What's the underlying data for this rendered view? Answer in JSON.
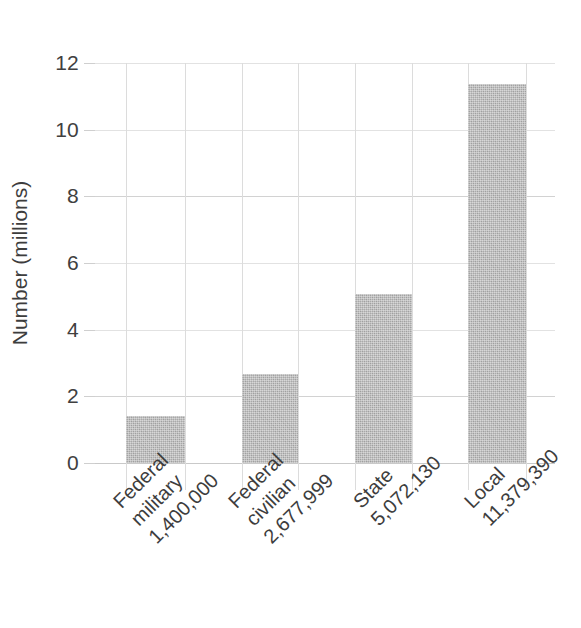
{
  "chart_data": {
    "type": "bar",
    "title": "",
    "subtitle": "",
    "xlabel": "",
    "ylabel": "Number (millions)",
    "categories": [
      "Federal military",
      "Federal civilian",
      "State",
      "Local"
    ],
    "category_lines": [
      [
        "Federal",
        "military",
        "1,400,000"
      ],
      [
        "Federal",
        "civilian",
        "2,677,999"
      ],
      [
        "State",
        "5,072,130"
      ],
      [
        "Local",
        "11,379,390"
      ]
    ],
    "data_labels": [
      "1,400,000",
      "2,677,999",
      "5,072,130",
      "11,379,390"
    ],
    "values": [
      1.4,
      2.678,
      5.072,
      11.379
    ],
    "raw_values": [
      1400000,
      2677999,
      5072130,
      11379390
    ],
    "units": "millions",
    "ylim": [
      0,
      12.6
    ],
    "yticks": [
      0,
      2,
      4,
      6,
      8,
      10,
      12
    ],
    "ytick_labels": [
      "0",
      "2",
      "4",
      "6",
      "8",
      "10",
      "12"
    ],
    "grid": {
      "horizontal": true,
      "vertical": true
    },
    "legend": {
      "visible": false,
      "position": "none"
    },
    "bar_color": "#a9a9a9",
    "grid_color": "#d8d8d8",
    "text_color": "#3d3d3d",
    "background_color": "#ffffff"
  }
}
